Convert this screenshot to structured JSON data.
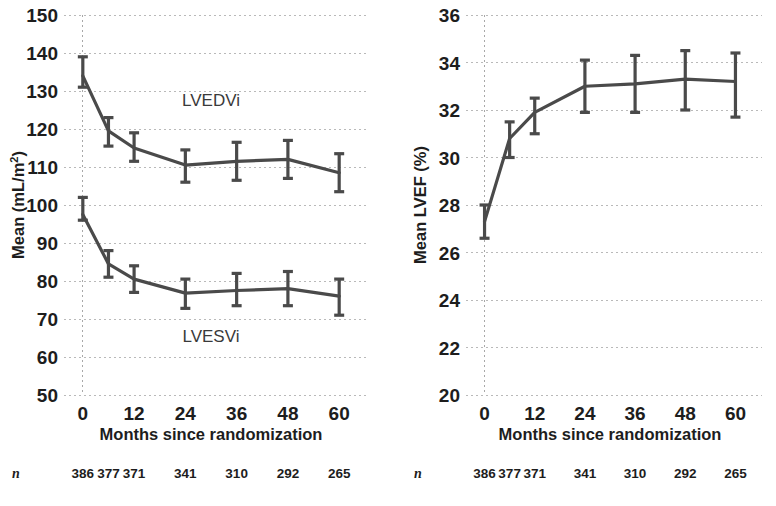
{
  "figure": {
    "caption_n_symbol": "n"
  },
  "chart_data": [
    {
      "id": "left",
      "type": "line",
      "title": "",
      "xlabel": "Months since randomization",
      "ylabel": "Mean (mL/m²)",
      "ylabel_main": "Mean (mL/m",
      "ylabel_sup": "2",
      "ylabel_tail": ")",
      "x": [
        0,
        6,
        12,
        24,
        36,
        48,
        60
      ],
      "xtick_values": [
        0,
        12,
        24,
        36,
        48,
        60
      ],
      "xtick_labels": [
        "0",
        "12",
        "24",
        "36",
        "48",
        "60"
      ],
      "xlim": [
        -3,
        63
      ],
      "ylim": [
        50,
        150
      ],
      "ytick_values": [
        50,
        60,
        70,
        80,
        90,
        100,
        110,
        120,
        130,
        140,
        150
      ],
      "ytick_labels": [
        "50",
        "60",
        "70",
        "80",
        "90",
        "100",
        "110",
        "120",
        "130",
        "140",
        "150"
      ],
      "grid": true,
      "legend_position": "inline-annotation",
      "series": [
        {
          "name": "LVEDVi",
          "annotation": "LVEDVi",
          "annotation_x": 30,
          "annotation_y": 126,
          "values": [
            134.0,
            119.5,
            115.0,
            110.5,
            111.5,
            112.0,
            108.5
          ],
          "err_low": [
            131.0,
            115.5,
            111.5,
            106.0,
            106.5,
            107.0,
            103.5
          ],
          "err_high": [
            139.0,
            123.0,
            119.0,
            114.5,
            116.5,
            117.0,
            113.5
          ]
        },
        {
          "name": "LVESVi",
          "annotation": "LVESVi",
          "annotation_x": 30,
          "annotation_y": 64,
          "values": [
            97.5,
            84.5,
            80.5,
            76.8,
            77.5,
            78.0,
            76.0
          ],
          "err_low": [
            96.0,
            81.0,
            77.0,
            72.8,
            73.5,
            73.5,
            71.0
          ],
          "err_high": [
            102.0,
            88.0,
            84.0,
            80.5,
            82.0,
            82.5,
            80.5
          ]
        }
      ],
      "n_row": {
        "label": "n",
        "values": [
          "386",
          "377",
          "371",
          "341",
          "310",
          "292",
          "265"
        ]
      }
    },
    {
      "id": "right",
      "type": "line",
      "title": "",
      "xlabel": "Months since randomization",
      "ylabel": "Mean LVEF (%)",
      "x": [
        0,
        6,
        12,
        24,
        36,
        48,
        60
      ],
      "xtick_values": [
        0,
        12,
        24,
        36,
        48,
        60
      ],
      "xtick_labels": [
        "0",
        "12",
        "24",
        "36",
        "48",
        "60"
      ],
      "xlim": [
        -3,
        63
      ],
      "ylim": [
        20,
        36
      ],
      "ytick_values": [
        20,
        22,
        24,
        26,
        28,
        30,
        32,
        34,
        36
      ],
      "ytick_labels": [
        "20",
        "22",
        "24",
        "26",
        "28",
        "30",
        "32",
        "34",
        "36"
      ],
      "grid": true,
      "legend_position": "none",
      "series": [
        {
          "name": "LVEF",
          "annotation": "",
          "values": [
            27.3,
            30.8,
            31.9,
            33.0,
            33.1,
            33.3,
            33.2
          ],
          "err_low": [
            26.6,
            30.0,
            31.0,
            31.9,
            31.9,
            32.0,
            31.7
          ],
          "err_high": [
            28.0,
            31.5,
            32.5,
            34.1,
            34.3,
            34.5,
            34.4
          ]
        }
      ],
      "n_row": {
        "label": "n",
        "values": [
          "386",
          "377",
          "371",
          "341",
          "310",
          "292",
          "265"
        ]
      }
    }
  ],
  "colors": {
    "series": "#4a4a4a",
    "grid": "#b9b9b9",
    "text": "#1d1d1d",
    "background": "#ffffff"
  }
}
